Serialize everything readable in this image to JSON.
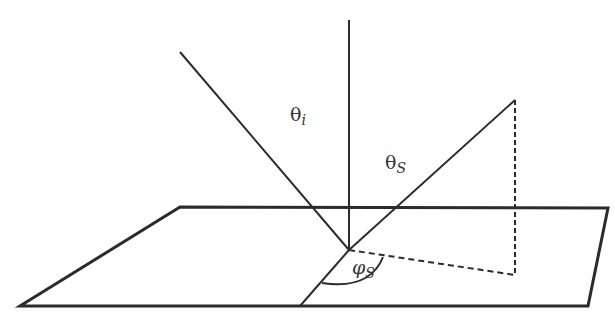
{
  "diagram": {
    "labels": {
      "theta_i": {
        "symbol": "θ",
        "subscript": "i"
      },
      "theta_s": {
        "symbol": "θ",
        "subscript": "S"
      },
      "phi_s": {
        "symbol": "φ",
        "subscript": "S"
      }
    },
    "colors": {
      "stroke": "#2b2b2b",
      "background": "#ffffff"
    },
    "elements": [
      "surface-plane",
      "surface-normal",
      "incident-ray",
      "scattered-ray",
      "scattered-projection-vertical",
      "scattered-projection-horizontal",
      "plane-of-incidence-line",
      "azimuth-arc"
    ]
  }
}
